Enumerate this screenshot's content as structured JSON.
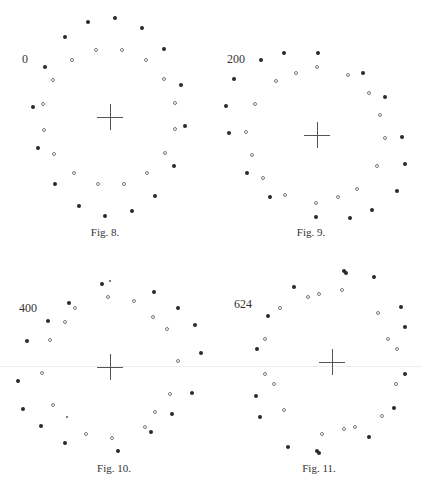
{
  "figures": [
    {
      "id": "fig8",
      "label": "0",
      "label_pos": [
        22,
        52
      ],
      "caption": "Fig. 8.",
      "caption_pos": [
        105,
        226
      ],
      "center": [
        110,
        117
      ],
      "cross_half": 13,
      "filled": [
        [
          88,
          22
        ],
        [
          115,
          18
        ],
        [
          142,
          28
        ],
        [
          65,
          37
        ],
        [
          164,
          49
        ],
        [
          45,
          67
        ],
        [
          181,
          85
        ],
        [
          33,
          107
        ],
        [
          185,
          126
        ],
        [
          38,
          148
        ],
        [
          174,
          166
        ],
        [
          55,
          184
        ],
        [
          155,
          196
        ],
        [
          79,
          206
        ],
        [
          132,
          211
        ],
        [
          105,
          216
        ]
      ],
      "open": [
        [
          96,
          50
        ],
        [
          122,
          50
        ],
        [
          72,
          60
        ],
        [
          146,
          60
        ],
        [
          53,
          80
        ],
        [
          164,
          79
        ],
        [
          43,
          104
        ],
        [
          175,
          103
        ],
        [
          44,
          130
        ],
        [
          175,
          129
        ],
        [
          54,
          154
        ],
        [
          165,
          153
        ],
        [
          74,
          173
        ],
        [
          147,
          173
        ],
        [
          98,
          184
        ],
        [
          124,
          184
        ]
      ],
      "tiny": []
    },
    {
      "id": "fig9",
      "label": "200",
      "label_pos": [
        227,
        52
      ],
      "caption": "Fig. 9.",
      "caption_pos": [
        311,
        226
      ],
      "center": [
        317,
        135
      ],
      "cross_half": 13,
      "filled": [
        [
          284,
          53
        ],
        [
          318,
          53
        ],
        [
          261,
          60
        ],
        [
          234,
          79
        ],
        [
          363,
          73
        ],
        [
          385,
          97
        ],
        [
          226,
          106
        ],
        [
          402,
          137
        ],
        [
          229,
          133
        ],
        [
          405,
          164
        ],
        [
          247,
          173
        ],
        [
          397,
          191
        ],
        [
          270,
          197
        ],
        [
          372,
          210
        ],
        [
          316,
          217
        ],
        [
          350,
          218
        ]
      ],
      "open": [
        [
          317,
          67
        ],
        [
          296,
          73
        ],
        [
          348,
          75
        ],
        [
          276,
          81
        ],
        [
          369,
          93
        ],
        [
          255,
          104
        ],
        [
          380,
          115
        ],
        [
          246,
          132
        ],
        [
          385,
          138
        ],
        [
          252,
          155
        ],
        [
          377,
          166
        ],
        [
          263,
          178
        ],
        [
          357,
          189
        ],
        [
          285,
          195
        ],
        [
          338,
          197
        ],
        [
          316,
          203
        ]
      ],
      "tiny": []
    },
    {
      "id": "fig10",
      "label": "400",
      "label_pos": [
        19,
        301
      ],
      "caption": "Fig. 10.",
      "caption_pos": [
        114,
        462
      ],
      "center": [
        110,
        367
      ],
      "cross_half": 13,
      "filled": [
        [
          102,
          284
        ],
        [
          154,
          292
        ],
        [
          69,
          303
        ],
        [
          178,
          308
        ],
        [
          48,
          321
        ],
        [
          195,
          325
        ],
        [
          27,
          341
        ],
        [
          201,
          353
        ],
        [
          18,
          381
        ],
        [
          192,
          393
        ],
        [
          23,
          409
        ],
        [
          172,
          414
        ],
        [
          41,
          426
        ],
        [
          151,
          432
        ],
        [
          65,
          443
        ],
        [
          118,
          451
        ]
      ],
      "open": [
        [
          75,
          308
        ],
        [
          108,
          297
        ],
        [
          134,
          301
        ],
        [
          65,
          322
        ],
        [
          153,
          317
        ],
        [
          167,
          329
        ],
        [
          50,
          340
        ],
        [
          178,
          361
        ],
        [
          42,
          373
        ],
        [
          170,
          394
        ],
        [
          53,
          405
        ],
        [
          155,
          412
        ],
        [
          145,
          427
        ],
        [
          86,
          434
        ],
        [
          112,
          438
        ]
      ],
      "tiny": [
        [
          110,
          281
        ],
        [
          67,
          417
        ]
      ]
    },
    {
      "id": "fig11",
      "label": "624",
      "label_pos": [
        234,
        297
      ],
      "caption": "Fig. 11.",
      "caption_pos": [
        319,
        462
      ],
      "center": [
        332,
        362
      ],
      "cross_half": 13,
      "filled": [
        [
          344,
          271
        ],
        [
          346,
          273
        ],
        [
          374,
          277
        ],
        [
          294,
          287
        ],
        [
          401,
          307
        ],
        [
          268,
          316
        ],
        [
          405,
          327
        ],
        [
          257,
          349
        ],
        [
          405,
          374
        ],
        [
          256,
          396
        ],
        [
          394,
          408
        ],
        [
          260,
          417
        ],
        [
          369,
          437
        ],
        [
          288,
          447
        ],
        [
          317,
          451
        ],
        [
          319,
          453
        ]
      ],
      "open": [
        [
          342,
          290
        ],
        [
          319,
          294
        ],
        [
          308,
          297
        ],
        [
          280,
          308
        ],
        [
          378,
          313
        ],
        [
          265,
          339
        ],
        [
          388,
          339
        ],
        [
          397,
          349
        ],
        [
          265,
          374
        ],
        [
          274,
          384
        ],
        [
          396,
          384
        ],
        [
          284,
          410
        ],
        [
          382,
          416
        ],
        [
          355,
          427
        ],
        [
          344,
          429
        ],
        [
          322,
          434
        ]
      ],
      "tiny": []
    }
  ],
  "rule": {
    "y": 366
  }
}
